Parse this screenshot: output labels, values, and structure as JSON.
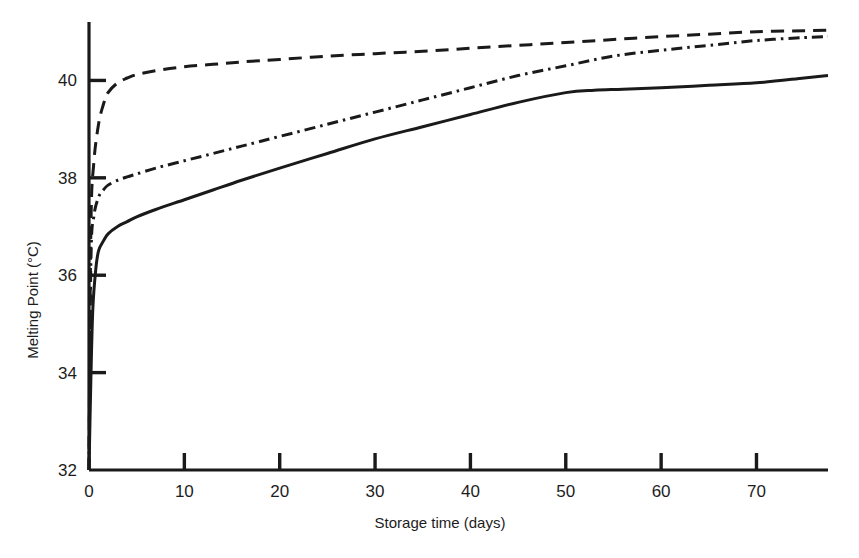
{
  "chart_data": {
    "type": "line",
    "title": "",
    "xlabel": "Storage time (days)",
    "ylabel": "Melting Point (°C)",
    "xlim": [
      0,
      77.5
    ],
    "ylim": [
      32,
      41.2
    ],
    "xticks": [
      0,
      10,
      20,
      30,
      40,
      50,
      60,
      70
    ],
    "yticks": [
      32,
      34,
      36,
      38,
      40
    ],
    "xtick_labels": [
      "0",
      "10",
      "20",
      "30",
      "40",
      "50",
      "60",
      "70"
    ],
    "ytick_labels": [
      "32",
      "34",
      "36",
      "38",
      "40"
    ],
    "grid": false,
    "legend": "none",
    "series": [
      {
        "name": "solid-curve",
        "style": "solid",
        "color": "#1a1a1a",
        "x": [
          0,
          0.2,
          0.4,
          0.7,
          1,
          1.5,
          2,
          3,
          4,
          5,
          7,
          10,
          13,
          16,
          20,
          25,
          30,
          35,
          40,
          45,
          50,
          53,
          56,
          60,
          65,
          70,
          75,
          77.5
        ],
        "y": [
          32.0,
          33.9,
          35.3,
          36.1,
          36.5,
          36.7,
          36.85,
          37.0,
          37.1,
          37.2,
          37.35,
          37.55,
          37.75,
          37.95,
          38.2,
          38.5,
          38.8,
          39.05,
          39.3,
          39.55,
          39.75,
          39.8,
          39.82,
          39.85,
          39.9,
          39.95,
          40.05,
          40.1
        ]
      },
      {
        "name": "dash-dot-curve",
        "style": "dash-dot",
        "color": "#1a1a1a",
        "x": [
          0,
          0.2,
          0.5,
          1,
          1.5,
          2,
          3,
          4,
          5,
          7,
          10,
          13,
          16,
          20,
          25,
          30,
          35,
          40,
          45,
          50,
          55,
          60,
          65,
          70,
          75,
          77.5
        ],
        "y": [
          32.0,
          36.3,
          37.2,
          37.6,
          37.75,
          37.85,
          37.95,
          38.02,
          38.08,
          38.2,
          38.35,
          38.5,
          38.65,
          38.85,
          39.1,
          39.35,
          39.6,
          39.85,
          40.1,
          40.3,
          40.5,
          40.62,
          40.72,
          40.82,
          40.88,
          40.9
        ]
      },
      {
        "name": "dashed-curve",
        "style": "dashed",
        "color": "#1a1a1a",
        "x": [
          0,
          0.2,
          0.5,
          1,
          1.5,
          2,
          3,
          4,
          5,
          7,
          10,
          13,
          16,
          20,
          25,
          30,
          35,
          40,
          45,
          50,
          55,
          60,
          65,
          70,
          75,
          77.5
        ],
        "y": [
          32.0,
          37.0,
          38.3,
          39.1,
          39.5,
          39.75,
          39.95,
          40.05,
          40.12,
          40.2,
          40.28,
          40.33,
          40.38,
          40.43,
          40.5,
          40.55,
          40.6,
          40.66,
          40.72,
          40.78,
          40.84,
          40.9,
          40.95,
          41.0,
          41.02,
          41.03
        ]
      }
    ]
  },
  "axes": {
    "y_axis_name": "melting-point-axis",
    "x_axis_name": "storage-time-axis"
  }
}
